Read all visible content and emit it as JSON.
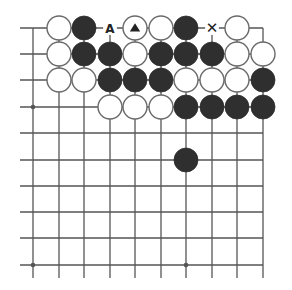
{
  "diagram": {
    "type": "go-board-fragment",
    "colors": {
      "black": "#2f2f2f",
      "white": "#ffffff",
      "line": "#555555",
      "stone_outline": "#6a6a6a",
      "marker": "#222222"
    },
    "grid": {
      "columns_x": [
        33,
        59,
        84,
        110,
        135,
        161,
        186,
        212,
        237,
        263
      ],
      "rows_y": [
        28,
        54,
        80,
        107,
        133,
        160,
        186,
        212,
        238,
        265
      ],
      "stone_radius": 12,
      "edges": {
        "top": true,
        "right": true,
        "left": false,
        "bottom": false
      }
    },
    "hoshi": [
      {
        "col": 0,
        "row": 3
      },
      {
        "col": 0,
        "row": 9
      },
      {
        "col": 6,
        "row": 9
      }
    ],
    "stones": [
      {
        "col": 1,
        "row": 0,
        "color": "white"
      },
      {
        "col": 2,
        "row": 0,
        "color": "black"
      },
      {
        "col": 4,
        "row": 0,
        "color": "white",
        "mark": "triangle"
      },
      {
        "col": 5,
        "row": 0,
        "color": "white"
      },
      {
        "col": 6,
        "row": 0,
        "color": "black"
      },
      {
        "col": 8,
        "row": 0,
        "color": "white"
      },
      {
        "col": 1,
        "row": 1,
        "color": "white"
      },
      {
        "col": 2,
        "row": 1,
        "color": "black"
      },
      {
        "col": 3,
        "row": 1,
        "color": "black"
      },
      {
        "col": 4,
        "row": 1,
        "color": "white"
      },
      {
        "col": 5,
        "row": 1,
        "color": "black"
      },
      {
        "col": 6,
        "row": 1,
        "color": "black"
      },
      {
        "col": 7,
        "row": 1,
        "color": "black"
      },
      {
        "col": 8,
        "row": 1,
        "color": "white"
      },
      {
        "col": 9,
        "row": 1,
        "color": "white"
      },
      {
        "col": 1,
        "row": 2,
        "color": "white"
      },
      {
        "col": 2,
        "row": 2,
        "color": "white"
      },
      {
        "col": 3,
        "row": 2,
        "color": "black"
      },
      {
        "col": 4,
        "row": 2,
        "color": "black"
      },
      {
        "col": 5,
        "row": 2,
        "color": "black"
      },
      {
        "col": 6,
        "row": 2,
        "color": "white"
      },
      {
        "col": 7,
        "row": 2,
        "color": "white"
      },
      {
        "col": 8,
        "row": 2,
        "color": "white"
      },
      {
        "col": 9,
        "row": 2,
        "color": "black"
      },
      {
        "col": 3,
        "row": 3,
        "color": "white"
      },
      {
        "col": 4,
        "row": 3,
        "color": "white"
      },
      {
        "col": 5,
        "row": 3,
        "color": "white"
      },
      {
        "col": 6,
        "row": 3,
        "color": "black"
      },
      {
        "col": 7,
        "row": 3,
        "color": "black"
      },
      {
        "col": 8,
        "row": 3,
        "color": "black"
      },
      {
        "col": 9,
        "row": 3,
        "color": "black"
      },
      {
        "col": 6,
        "row": 5,
        "color": "black"
      }
    ],
    "labels": [
      {
        "col": 3,
        "row": 0,
        "text": "A"
      },
      {
        "col": 7,
        "row": 0,
        "text": "✕"
      }
    ]
  }
}
